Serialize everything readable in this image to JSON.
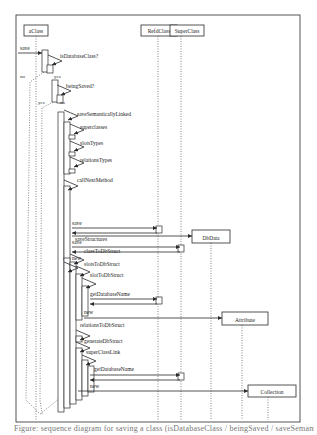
{
  "figure": {
    "frame": {
      "x": 16,
      "y": 15,
      "w": 284,
      "h": 407
    },
    "colors": {
      "ink": "#2a2a2a",
      "dotted": "#555555",
      "paper": "#ffffff"
    },
    "caption": "Figure: sequence diagram for saving a class (isDatabaseClass / beingSaved / saveSemanticallyLinked / saveStructures)"
  },
  "lifelines": [
    {
      "id": "aClass",
      "label": "aClass",
      "x": 36,
      "box": {
        "x": 24,
        "y": 25,
        "w": 24,
        "h": 11
      },
      "top": 36,
      "bottom": 420,
      "dotted": false
    },
    {
      "id": "RefdClass",
      "label": "RefdClass",
      "x": 158,
      "box": {
        "x": 141,
        "y": 25,
        "w": 36,
        "h": 11
      },
      "top": 36,
      "bottom": 420,
      "dotted": true
    },
    {
      "id": "SuperClass",
      "label": "SuperClass",
      "x": 181,
      "box": {
        "x": 170,
        "y": 25,
        "w": 34,
        "h": 11
      },
      "top": 36,
      "bottom": 420,
      "dotted": true
    },
    {
      "id": "DbData",
      "label": "DbData",
      "x": 211,
      "box": {
        "x": 192,
        "y": 230,
        "w": 38,
        "h": 13
      },
      "top": 243,
      "bottom": 420,
      "dotted": true
    },
    {
      "id": "Attribute",
      "label": "Attribute",
      "x": 242,
      "box": {
        "x": 222,
        "y": 312,
        "w": 46,
        "h": 13
      },
      "top": 325,
      "bottom": 420,
      "dotted": true
    },
    {
      "id": "Collection",
      "label": "Collection",
      "x": 268,
      "box": {
        "x": 248,
        "y": 385,
        "w": 48,
        "h": 12
      },
      "top": 397,
      "bottom": 420,
      "dotted": true
    }
  ],
  "messages": [
    {
      "label": "save",
      "from_x": 18,
      "to_x": 42,
      "y": 53,
      "label_x": 20,
      "label_y": 50,
      "kind": "call"
    },
    {
      "label": "save",
      "from_x": 72,
      "to_x": 157,
      "y": 228,
      "label_x": 72,
      "label_y": 225,
      "kind": "call",
      "return_y": 233
    },
    {
      "label": "save",
      "from_x": 72,
      "to_x": 180,
      "y": 247,
      "label_x": 72,
      "label_y": 244,
      "kind": "call",
      "return_y": 252
    },
    {
      "label": "new",
      "from_x": 72,
      "to_x": 192,
      "y": 236,
      "label_x": 72,
      "label_y": 260,
      "kind": "create"
    },
    {
      "label": "getDatabaseName",
      "from_x": 90,
      "to_x": 157,
      "y": 299,
      "label_x": 90,
      "label_y": 296,
      "kind": "call",
      "return_y": 304
    },
    {
      "label": "new",
      "from_x": 84,
      "to_x": 222,
      "y": 318,
      "label_x": 84,
      "label_y": 314,
      "kind": "create"
    },
    {
      "label": "getDatabaseName",
      "from_x": 90,
      "to_x": 180,
      "y": 375,
      "label_x": 94,
      "label_y": 371,
      "kind": "call",
      "return_y": 380
    },
    {
      "label": "new",
      "from_x": 78,
      "to_x": 248,
      "y": 391,
      "label_x": 90,
      "label_y": 388,
      "kind": "create"
    }
  ],
  "self_calls": [
    {
      "label": "isDatabaseClass?",
      "x": 48,
      "y": 55,
      "label_x": 60,
      "label_y": 58
    },
    {
      "label": "beingSaved?",
      "x": 57,
      "y": 85,
      "label_x": 66,
      "label_y": 88
    },
    {
      "label": "saveSemanticallyLinked",
      "x": 64,
      "y": 110,
      "label_x": 77,
      "label_y": 116
    },
    {
      "label": "superclasses",
      "x": 70,
      "y": 124,
      "label_x": 80,
      "label_y": 129
    },
    {
      "label": "slotsTypes",
      "x": 70,
      "y": 141,
      "label_x": 80,
      "label_y": 145
    },
    {
      "label": "relationsTypes",
      "x": 70,
      "y": 157,
      "label_x": 80,
      "label_y": 162
    },
    {
      "label": "callNextMethod",
      "x": 64,
      "y": 180,
      "label_x": 77,
      "label_y": 182
    },
    {
      "label": "saveStructures",
      "x": 64,
      "y": 262,
      "label_x": 75,
      "label_y": 241
    },
    {
      "label": "classToDbStruct",
      "x": 70,
      "y": 254,
      "label_x": 84,
      "label_y": 253
    },
    {
      "label": "slotsToDbStruct",
      "x": 76,
      "y": 266,
      "label_x": 84,
      "label_y": 266
    },
    {
      "label": "slotToDbStruct",
      "x": 82,
      "y": 278,
      "label_x": 90,
      "label_y": 277
    },
    {
      "label": "relationsToDbStruct",
      "x": 76,
      "y": 330,
      "label_x": 80,
      "label_y": 327
    },
    {
      "label": "generateDbStruct",
      "x": 76,
      "y": 342,
      "label_x": 84,
      "label_y": 343
    },
    {
      "label": "superClassLink",
      "x": 82,
      "y": 355,
      "label_x": 86,
      "label_y": 354
    }
  ],
  "activations": [
    {
      "x": 42,
      "y": 50,
      "w": 6,
      "h": 22
    },
    {
      "x": 47,
      "y": 65,
      "w": 6,
      "h": 8
    },
    {
      "x": 52,
      "y": 80,
      "w": 6,
      "h": 22
    },
    {
      "x": 57,
      "y": 95,
      "w": 6,
      "h": 8
    },
    {
      "x": 58,
      "y": 112,
      "w": 6,
      "h": 300
    },
    {
      "x": 64,
      "y": 122,
      "w": 6,
      "h": 52
    },
    {
      "x": 69,
      "y": 135,
      "w": 6,
      "h": 4
    },
    {
      "x": 69,
      "y": 152,
      "w": 6,
      "h": 4
    },
    {
      "x": 69,
      "y": 169,
      "w": 6,
      "h": 4
    },
    {
      "x": 64,
      "y": 186,
      "w": 6,
      "h": 74
    },
    {
      "x": 64,
      "y": 258,
      "w": 6,
      "h": 150
    },
    {
      "x": 70,
      "y": 262,
      "w": 6,
      "h": 142
    },
    {
      "x": 76,
      "y": 274,
      "w": 6,
      "h": 46
    },
    {
      "x": 82,
      "y": 286,
      "w": 6,
      "h": 30
    },
    {
      "x": 76,
      "y": 336,
      "w": 6,
      "h": 6
    },
    {
      "x": 76,
      "y": 348,
      "w": 6,
      "h": 52
    },
    {
      "x": 82,
      "y": 360,
      "w": 6,
      "h": 36
    },
    {
      "x": 88,
      "y": 366,
      "w": 6,
      "h": 26
    },
    {
      "x": 156,
      "y": 226,
      "w": 6,
      "h": 7
    },
    {
      "x": 178,
      "y": 245,
      "w": 6,
      "h": 7
    },
    {
      "x": 156,
      "y": 297,
      "w": 6,
      "h": 7
    },
    {
      "x": 178,
      "y": 373,
      "w": 6,
      "h": 7
    }
  ],
  "guards": [
    {
      "label": "no",
      "x": 20,
      "y": 78
    },
    {
      "label": "yes",
      "x": 54,
      "y": 78
    },
    {
      "label": "yes",
      "x": 38,
      "y": 104
    },
    {
      "label": "no",
      "x": 60,
      "y": 104
    }
  ],
  "branch_paths": [
    {
      "name": "no-branch-isDatabaseClass",
      "points": [
        [
          44,
          72
        ],
        [
          30,
          82
        ],
        [
          26,
          400
        ],
        [
          40,
          414
        ]
      ]
    },
    {
      "name": "yes-branch-beingSaved",
      "points": [
        [
          53,
          102
        ],
        [
          42,
          108
        ],
        [
          40,
          400
        ],
        [
          42,
          414
        ]
      ]
    },
    {
      "name": "join-bottom",
      "points": [
        [
          40,
          414
        ],
        [
          60,
          398
        ]
      ]
    }
  ]
}
